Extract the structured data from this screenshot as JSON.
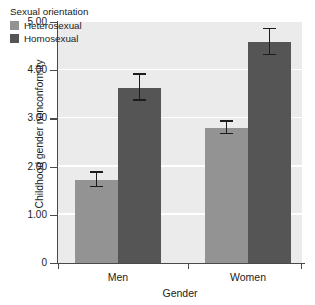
{
  "chart_data": {
    "type": "bar",
    "title": "",
    "xlabel": "Gender",
    "ylabel": "Childhood gender nonconformity",
    "categories": [
      "Men",
      "Women"
    ],
    "ylim": [
      0,
      5.0
    ],
    "yticks": [
      "0",
      "1.00",
      "2.00",
      "3.00",
      "4.00",
      "5.00"
    ],
    "ytick_values": [
      0,
      1.0,
      2.0,
      3.0,
      4.0,
      5.0
    ],
    "grid": true,
    "grid_color": "#ffffff",
    "plot_background": "#ebebeb",
    "legend": {
      "title": "Sexual orientation",
      "position": "top-left-inside",
      "entries": [
        {
          "label": "Heterosexual",
          "color": "#939393"
        },
        {
          "label": "Homosexual",
          "color": "#555555"
        }
      ]
    },
    "series": [
      {
        "name": "Heterosexual",
        "color": "#939393",
        "values": [
          1.72,
          2.8
        ],
        "errors": [
          0.15,
          0.13
        ]
      },
      {
        "name": "Homosexual",
        "color": "#555555",
        "values": [
          3.63,
          4.58
        ],
        "errors": [
          0.27,
          0.27
        ]
      }
    ],
    "error_bar_type": "confidence-interval"
  }
}
